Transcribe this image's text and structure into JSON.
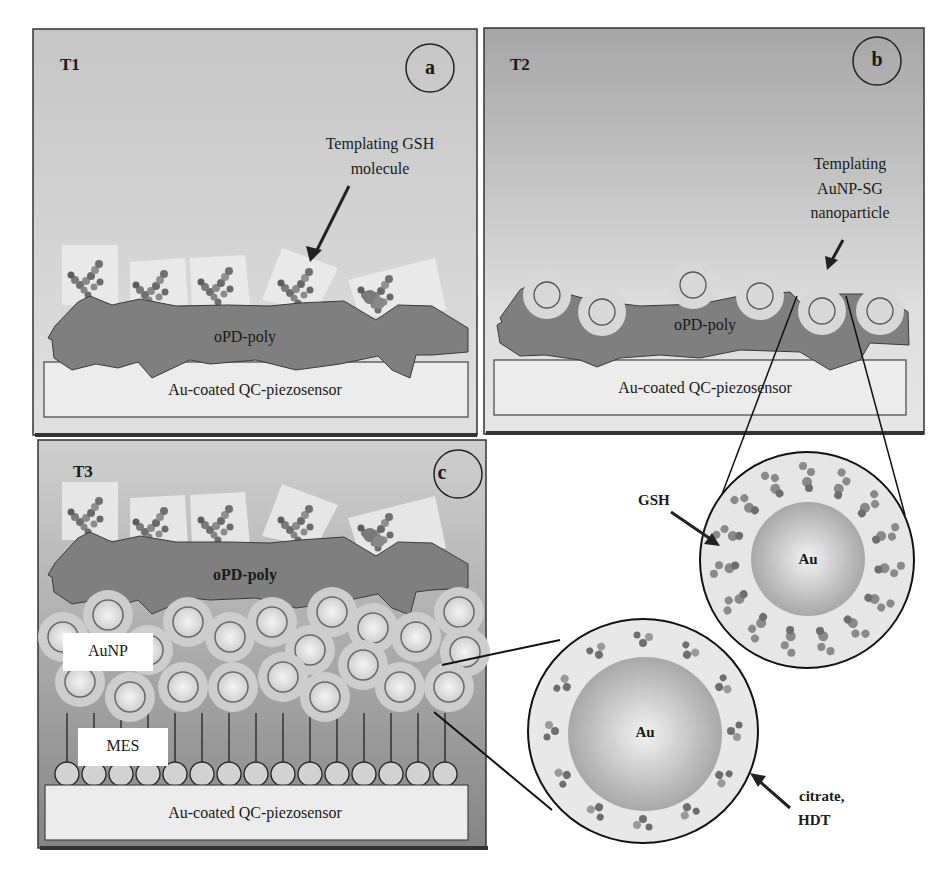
{
  "figure": {
    "panels": [
      {
        "id": "a",
        "tag": "T1",
        "letter": "a",
        "annotation_line1": "Templating GSH",
        "annotation_line2": "molecule",
        "polymer_label": "oPD-poly",
        "substrate_label": "Au-coated QC-piezosensor"
      },
      {
        "id": "b",
        "tag": "T2",
        "letter": "b",
        "annotation_line1": "Templating",
        "annotation_line2": "AuNP-SG",
        "annotation_line3": "nanoparticle",
        "polymer_label": "oPD-poly",
        "substrate_label": "Au-coated QC-piezosensor"
      },
      {
        "id": "c",
        "tag": "T3",
        "letter": "c",
        "polymer_label": "oPD-poly",
        "nanoparticle_layer_label": "AuNP",
        "monolayer_label": "MES",
        "substrate_label": "Au-coated QC-piezosensor"
      }
    ],
    "insets": [
      {
        "id": "gsh-inset",
        "core_label": "Au",
        "shell_label": "GSH"
      },
      {
        "id": "citrate-inset",
        "core_label": "Au",
        "shell_label_line1": "citrate,",
        "shell_label_line2": "HDT"
      }
    ],
    "colors": {
      "panel_bg_top": "#c9c9c9",
      "panel_bg_bottom": "#dcdcdc",
      "panel_b_bg_top": "#a9a9a9",
      "panel_c_bg_bottom": "#8a8a8a",
      "polymer": "#7f7f7f",
      "substrate": "#ececec",
      "border": "#333333",
      "shell": "#cfcfcf",
      "core": "#b5b5b5"
    }
  }
}
